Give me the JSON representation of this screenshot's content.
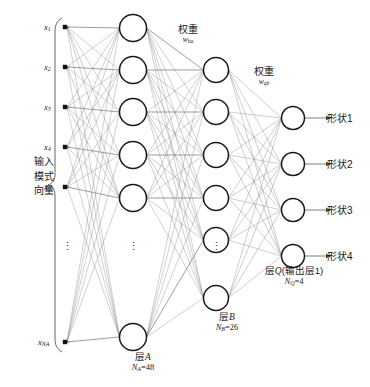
{
  "diagram": {
    "side_label": {
      "lines": [
        "输入",
        "模式",
        "向量"
      ],
      "text": "输入模式向量"
    },
    "inputs": {
      "nodes": [
        {
          "name": "x",
          "sub": "1"
        },
        {
          "name": "x",
          "sub": "2"
        },
        {
          "name": "x",
          "sub": "3"
        },
        {
          "name": "x",
          "sub": "4"
        },
        {
          "name": "x",
          "sub": "5"
        },
        {
          "name": "x",
          "sub": "NA"
        }
      ],
      "ellipsis": "⋮"
    },
    "weights": [
      {
        "cjk": "权重",
        "symbol": "w",
        "sub": "ba"
      },
      {
        "cjk": "权重",
        "symbol": "w",
        "sub": "qb"
      }
    ],
    "layers": [
      {
        "id": "A",
        "cjk": "层",
        "letter": "A",
        "count_symbol": "N",
        "count_sub": "A",
        "count_value": "48",
        "count_text": "NA=48",
        "visible_nodes": 6,
        "ellipsis": "⋮"
      },
      {
        "id": "B",
        "cjk": "层",
        "letter": "B",
        "count_symbol": "N",
        "count_sub": "B",
        "count_value": "26",
        "count_text": "NB=26",
        "visible_nodes": 6,
        "ellipsis": "⋮"
      },
      {
        "id": "Q",
        "cjk": "层",
        "letter": "Q",
        "suffix": "(输出层1)",
        "count_symbol": "N",
        "count_sub": "Q",
        "count_value": "4",
        "count_text": "NQ=4",
        "visible_nodes": 4
      }
    ],
    "outputs": [
      {
        "label": "形状1"
      },
      {
        "label": "形状2"
      },
      {
        "label": "形状3"
      },
      {
        "label": "形状4"
      }
    ],
    "colors": {
      "background": "#ffffff",
      "node_stroke": "#1a1a1a",
      "edge": "#8c8c8c",
      "edge_strong": "#6e6e6e",
      "text": "#1a1a1a",
      "brace": "#555555"
    }
  }
}
